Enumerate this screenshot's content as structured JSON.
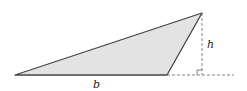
{
  "diagram": {
    "labels": {
      "base": "b",
      "height": "h"
    },
    "colors": {
      "fill": "#e3e3e3",
      "stroke": "#444444",
      "dashed": "#777777"
    },
    "vertices": [
      [
        15,
        75
      ],
      [
        167,
        75
      ],
      [
        202,
        13
      ]
    ]
  }
}
